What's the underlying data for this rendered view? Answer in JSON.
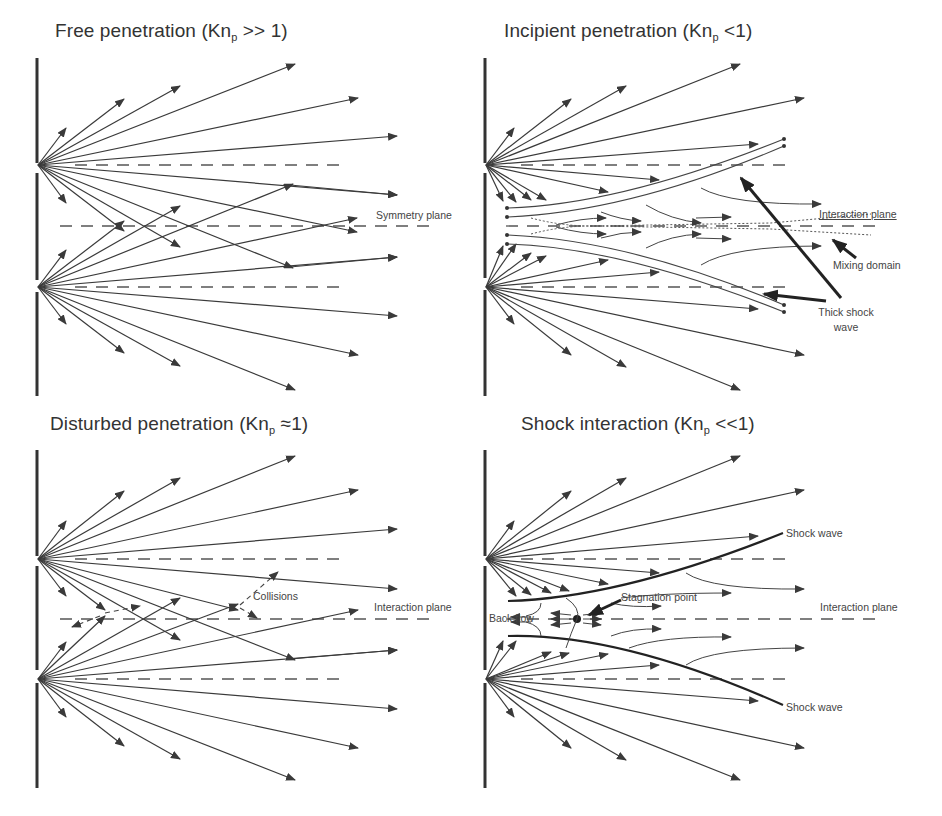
{
  "figure": {
    "panels": [
      {
        "id": "free",
        "title_main": "Free penetration (Kn",
        "title_sub": "p",
        "title_tail": " >> 1)",
        "labels": {
          "plane": "Symmetry plane"
        }
      },
      {
        "id": "incipient",
        "title_main": "Incipient penetration (Kn",
        "title_sub": "p",
        "title_tail": " <1)",
        "labels": {
          "plane": "Interaction plane",
          "mixing": "Mixing domain",
          "shock_line1": "Thick shock",
          "shock_line2": "wave"
        }
      },
      {
        "id": "disturbed",
        "title_main": "Disturbed penetration (Kn",
        "title_sub": "p",
        "title_tail": " ≈1)",
        "labels": {
          "plane": "Interaction plane",
          "collisions": "Collisions"
        }
      },
      {
        "id": "shock",
        "title_main": "Shock interaction (Kn",
        "title_sub": "p",
        "title_tail": " <<1)",
        "labels": {
          "plane": "Interaction plane",
          "stagnation": "Stagnation point",
          "backflow": "Back flow",
          "shock_upper": "Shock wave",
          "shock_lower": "Shock wave"
        }
      }
    ],
    "colors": {
      "line": "#3a3a3a",
      "dash": "#555555",
      "text": "#333333",
      "shock": "#2a2a2a"
    }
  }
}
